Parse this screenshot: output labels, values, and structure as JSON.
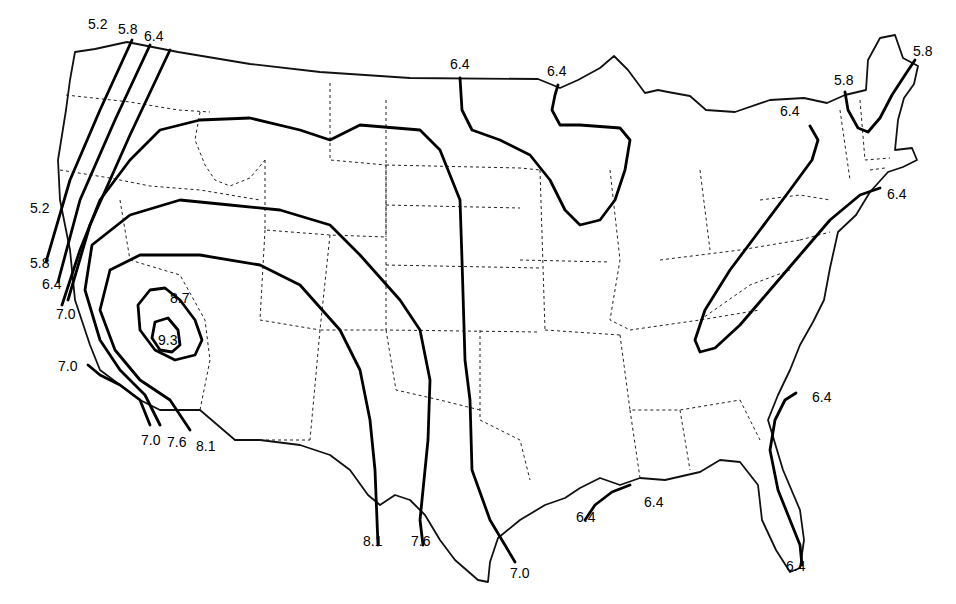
{
  "map": {
    "type": "isoline-map",
    "region": "contiguous-united-states",
    "colors": {
      "background": "#ffffff",
      "lines": "#000000"
    },
    "contour_levels": [
      "5.2",
      "5.8",
      "6.4",
      "7.0",
      "7.6",
      "8.1",
      "8.7",
      "9.3"
    ],
    "labels": [
      {
        "text": "5.2",
        "x": 88,
        "y": 29
      },
      {
        "text": "5.8",
        "x": 118,
        "y": 34
      },
      {
        "text": "6.4",
        "x": 144,
        "y": 41
      },
      {
        "text": "5.2",
        "x": 30,
        "y": 213
      },
      {
        "text": "5.8",
        "x": 30,
        "y": 268
      },
      {
        "text": "6.4",
        "x": 42,
        "y": 289
      },
      {
        "text": "7.0",
        "x": 56,
        "y": 319
      },
      {
        "text": "7.0",
        "x": 58,
        "y": 371
      },
      {
        "text": "8.7",
        "x": 170,
        "y": 303
      },
      {
        "text": "9.3",
        "x": 158,
        "y": 345
      },
      {
        "text": "7.0",
        "x": 141,
        "y": 445
      },
      {
        "text": "7.6",
        "x": 167,
        "y": 447
      },
      {
        "text": "8.1",
        "x": 196,
        "y": 451
      },
      {
        "text": "6.4",
        "x": 450,
        "y": 69
      },
      {
        "text": "6.4",
        "x": 547,
        "y": 76
      },
      {
        "text": "8.1",
        "x": 363,
        "y": 546
      },
      {
        "text": "7.6",
        "x": 411,
        "y": 546
      },
      {
        "text": "7.0",
        "x": 510,
        "y": 578
      },
      {
        "text": "6.4",
        "x": 576,
        "y": 522
      },
      {
        "text": "6.4",
        "x": 644,
        "y": 507
      },
      {
        "text": "6.4",
        "x": 780,
        "y": 116
      },
      {
        "text": "5.8",
        "x": 834,
        "y": 85
      },
      {
        "text": "5.8",
        "x": 913,
        "y": 56
      },
      {
        "text": "6.4",
        "x": 887,
        "y": 199
      },
      {
        "text": "6.4",
        "x": 812,
        "y": 402
      },
      {
        "text": "6.4",
        "x": 786,
        "y": 571
      }
    ],
    "outline": "M95,49 L127,42 L178,52 L250,64 L320,72 L410,78 L538,79 L560,88 L578,80 L600,68 L614,56 L628,70 L645,93 L658,90 L668,92 L690,96 L706,110 L735,112 L770,100 L804,98 L827,103 L845,95 L866,90 L868,60 L880,38 L895,35 L903,58 L918,66 L914,84 L904,98 L898,120 L895,150 L912,148 L917,160 L903,167 L888,172 L870,192 L856,215 L838,232 L830,268 L824,300 L813,322 L800,345 L790,370 L778,395 L768,420 L783,470 L800,510 L804,540 L800,568 L790,572 L776,550 L762,520 L758,485 L740,462 L720,460 L700,472 L665,480 L640,478 L620,485 L600,478 L580,488 L565,498 L545,505 L520,520 L498,538 L490,562 L488,582 L478,580 L455,560 L440,540 L425,515 L410,500 L395,495 L380,505 L368,495 L350,470 L330,455 L300,445 L260,440 L235,440 L200,410 L160,410 L140,400 L120,385 L100,370 L90,345 L75,300 L70,250 L60,200 L58,160 L66,110 L70,80 L75,52 Z",
    "states": [
      "M66,95 L130,102 L178,110 L210,112",
      "M60,170 L110,178 L150,186 L200,190 L260,200",
      "M200,112 L195,140 L205,165 L215,180 L230,186 L250,178 L265,160",
      "M265,160 L265,230 L330,235 L386,237",
      "M330,83 L330,160 L386,165 L386,237",
      "M386,100 L386,330 L540,332",
      "M386,165 L520,168 L540,170",
      "M386,205 L520,208",
      "M386,265 L540,268",
      "M330,235 L320,330 L386,330",
      "M265,230 L260,320 L320,330",
      "M130,260 L180,275 L205,320 L210,360 L200,410",
      "M120,200 L130,260",
      "M320,330 L310,440",
      "M260,440 L310,440",
      "M386,330 L396,390 L440,400 L480,410",
      "M480,330 L480,420 L520,440 L530,480",
      "M540,170 L545,330",
      "M520,260 L610,262",
      "M545,330 L620,335",
      "M610,170 L620,260 L610,320 L630,330",
      "M620,335 L630,410 L680,410 L740,400",
      "M630,330 L700,320 L760,310",
      "M660,260 L740,250 L800,240",
      "M680,410 L690,470",
      "M630,410 L640,478",
      "M740,400 L760,440",
      "M700,170 L710,250",
      "M760,200 L800,195 L830,200",
      "M800,240 L830,232",
      "M700,320 L750,285 L790,270",
      "M840,110 L850,180",
      "M860,100 L865,160 L890,158",
      "M870,170 L885,168"
    ],
    "contours": [
      {
        "level": "5.2",
        "d": "M132,40 L100,110 L70,180 L46,262"
      },
      {
        "level": "5.8",
        "d": "M150,45 L115,120 L80,200 L58,282"
      },
      {
        "level": "6.4",
        "d": "M170,50 L130,135 L90,225 L68,300"
      },
      {
        "level": "7.0",
        "d": "M62,305 L80,250 L100,200 L130,160 L160,130 L200,120 L250,118 L300,130 L330,140 L360,125 L420,130 L440,150 L460,200 L462,260 L465,360 L470,400 L472,470 L490,520 L515,562"
      },
      {
        "level": "7.0",
        "d": "M88,365 L100,375 L120,385 L140,400 L150,425"
      },
      {
        "level": "7.6",
        "d": "M160,425 L145,395 L120,370 L100,340 L85,290 L92,245 L130,215 L180,200 L230,205 L280,210 L330,225 L360,255 L400,300 L420,330 L430,380 L428,440 L420,520 L423,545"
      },
      {
        "level": "8.1",
        "d": "M190,430 L170,400 L140,380 L115,350 L100,310 L110,270 L140,255 L200,255 L260,265 L300,285 L340,330 L360,370 L370,420 L375,470 L378,545"
      },
      {
        "level": "8.7",
        "d": "M150,290 L165,288 L180,300 L195,320 L202,340 L195,355 L175,360 L155,350 L140,330 L138,305 Z"
      },
      {
        "level": "9.3",
        "d": "M155,322 L168,318 L178,330 L180,345 L172,352 L160,350 L152,338 Z"
      },
      {
        "level": "6.4",
        "d": "M460,78 L462,110 L472,130 L500,140 L530,155 L550,180 L565,210 L580,225 L600,220 L615,200 L625,170 L630,140 L620,128 L580,125 L560,125 L552,110 L555,95 L558,85"
      },
      {
        "level": "6.4",
        "d": "M810,126 L818,140 L812,160 L790,190 L760,230 L730,270 L705,310 L695,340 L700,352 L715,348 L740,325 L770,290 L800,255 L830,220 L860,195 L880,188"
      },
      {
        "level": "5.8",
        "d": "M845,92 L848,110 L858,128 L868,132 L880,118 L892,95 L905,75 L915,60"
      },
      {
        "level": "6.4",
        "d": "M796,393 L785,400 L775,420 L770,450 L778,490 L790,520 L800,545 L802,565"
      },
      {
        "level": "6.4",
        "d": "M585,520 L595,505 L612,492 L630,485"
      }
    ]
  }
}
